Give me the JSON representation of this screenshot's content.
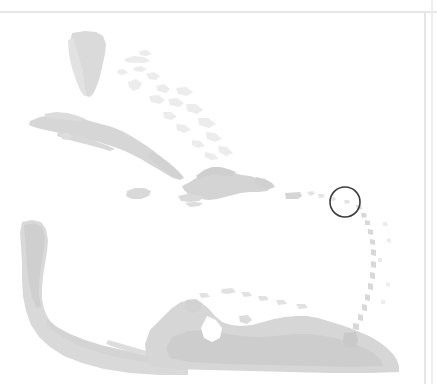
{
  "figure": {
    "kind": "locator-map",
    "region_name": "Caribbean Basin",
    "caption": "",
    "background_color": "#ffffff",
    "land_color": "#d9d9d9",
    "land_color_faint": "#e9e9e9",
    "land_color_dense": "#cfcfcf",
    "annotation_color": "#3c3c3c",
    "border_color": "#e6e6e6",
    "width": 437,
    "height": 384
  },
  "annotations": [
    {
      "id": "highlight-circle",
      "shape": "circle",
      "label": "Lesser Antilles highlight",
      "cx": 345,
      "cy": 202,
      "r": 15,
      "stroke": "#3c3c3c",
      "stroke_width": 1.6,
      "fill": "none"
    }
  ],
  "landmasses": [
    {
      "id": "florida",
      "label": "Florida"
    },
    {
      "id": "bahamas",
      "label": "Bahamas"
    },
    {
      "id": "cuba",
      "label": "Cuba"
    },
    {
      "id": "jamaica",
      "label": "Jamaica"
    },
    {
      "id": "hispaniola",
      "label": "Hispaniola"
    },
    {
      "id": "puerto-rico",
      "label": "Puerto Rico"
    },
    {
      "id": "lesser-antilles",
      "label": "Lesser Antilles"
    },
    {
      "id": "central-america",
      "label": "Central America"
    },
    {
      "id": "south-america",
      "label": "South America"
    },
    {
      "id": "trinidad",
      "label": "Trinidad"
    }
  ],
  "scan_borders": {
    "top_label": "page-edge-top",
    "right_label": "page-edge-right"
  }
}
